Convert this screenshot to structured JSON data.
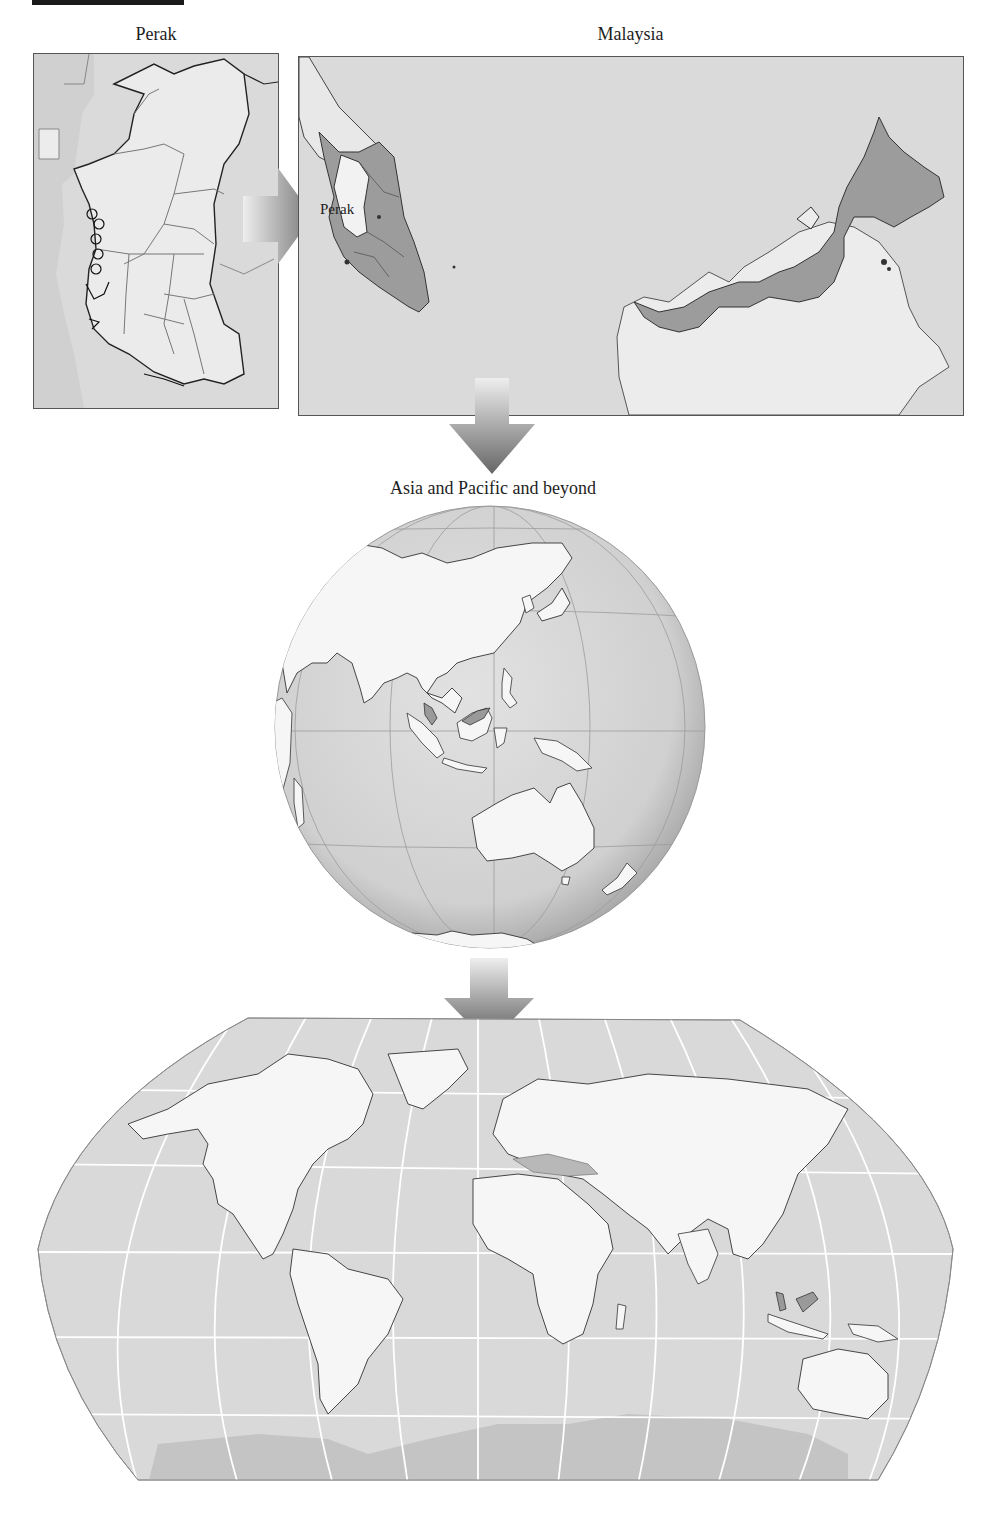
{
  "figure": {
    "header_bar": "",
    "panels": [
      {
        "id": "perak",
        "title": "Perak"
      },
      {
        "id": "malaysia",
        "title": "Malaysia",
        "inset_label": "Perak"
      },
      {
        "id": "globe",
        "title": "Asia and Pacific and beyond"
      },
      {
        "id": "world",
        "title": ""
      }
    ],
    "arrows": [
      {
        "from": "perak",
        "to": "malaysia",
        "direction": "right"
      },
      {
        "from": "malaysia",
        "to": "globe",
        "direction": "down"
      },
      {
        "from": "globe",
        "to": "world",
        "direction": "down"
      }
    ],
    "colors": {
      "sea": "#d9d9d9",
      "land": "#f5f5f5",
      "highlight": "#9a9a9a",
      "border": "#333333",
      "graticule": "#ffffff",
      "antarctica": "#c4c4c4"
    }
  }
}
